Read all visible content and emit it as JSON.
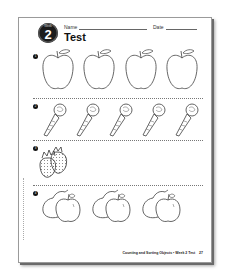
{
  "worksheet": {
    "badge": {
      "label": "Week",
      "number": "2"
    },
    "name_label": "Name",
    "date_label": "Date",
    "title": "Test",
    "problems": [
      {
        "number": "1",
        "items": [
          "apple",
          "apple",
          "apple",
          "apple"
        ],
        "count": 4
      },
      {
        "number": "2",
        "items": [
          "carrot",
          "carrot",
          "carrot",
          "carrot",
          "carrot"
        ],
        "count": 5
      },
      {
        "number": "3",
        "items": [
          "strawberry",
          "strawberry"
        ],
        "count": 2
      },
      {
        "number": "4",
        "items": [
          "pear-and-apple",
          "pear-and-apple",
          "pear-and-apple"
        ],
        "count": 3
      }
    ],
    "footer": "Counting and Sorting Objects • Week 2 Test",
    "page_number": "27"
  }
}
